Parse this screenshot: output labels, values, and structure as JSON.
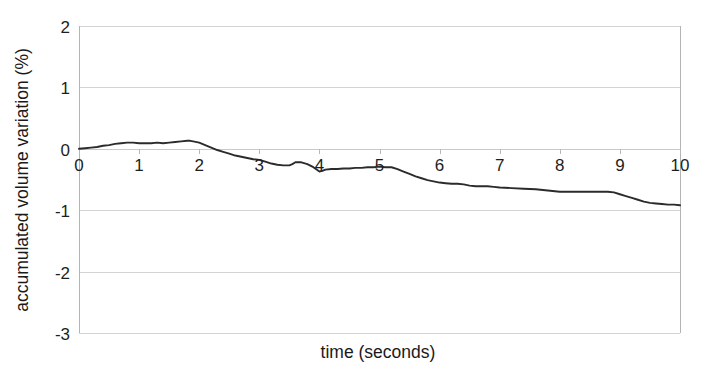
{
  "chart_data": {
    "type": "line",
    "title": "",
    "xlabel": "time (seconds)",
    "ylabel": "accumulated volume variation (%)",
    "xlim": [
      0,
      10
    ],
    "ylim": [
      -3,
      2
    ],
    "xticks": [
      "0",
      "1",
      "2",
      "3",
      "4",
      "5",
      "6",
      "7",
      "8",
      "9",
      "10"
    ],
    "yticks": [
      "2",
      "1",
      "0",
      "-1",
      "-2",
      "-3"
    ],
    "grid": true,
    "legend": "none",
    "series": [
      {
        "name": "accumulated volume variation",
        "color": "#2b2b2b",
        "x": [
          0.0,
          0.1,
          0.2,
          0.3,
          0.4,
          0.5,
          0.6,
          0.7,
          0.8,
          0.9,
          1.0,
          1.1,
          1.2,
          1.3,
          1.4,
          1.5,
          1.6,
          1.7,
          1.8,
          1.85,
          1.9,
          2.0,
          2.1,
          2.2,
          2.3,
          2.4,
          2.5,
          2.6,
          2.7,
          2.8,
          2.9,
          3.0,
          3.1,
          3.2,
          3.3,
          3.4,
          3.5,
          3.55,
          3.6,
          3.7,
          3.8,
          3.9,
          4.0,
          4.05,
          4.1,
          4.2,
          4.3,
          4.4,
          4.5,
          4.6,
          4.7,
          4.8,
          4.9,
          5.0,
          5.1,
          5.2,
          5.3,
          5.4,
          5.5,
          5.6,
          5.7,
          5.8,
          5.9,
          6.0,
          6.1,
          6.2,
          6.3,
          6.4,
          6.5,
          6.6,
          6.7,
          6.8,
          6.9,
          7.0,
          7.2,
          7.4,
          7.6,
          7.8,
          8.0,
          8.2,
          8.4,
          8.6,
          8.8,
          8.9,
          9.0,
          9.1,
          9.2,
          9.3,
          9.4,
          9.5,
          9.6,
          9.7,
          9.8,
          9.9,
          10.0
        ],
        "y": [
          0.0,
          0.01,
          0.02,
          0.03,
          0.05,
          0.06,
          0.08,
          0.09,
          0.1,
          0.1,
          0.09,
          0.09,
          0.09,
          0.1,
          0.09,
          0.1,
          0.11,
          0.12,
          0.13,
          0.13,
          0.12,
          0.1,
          0.06,
          0.02,
          -0.02,
          -0.05,
          -0.08,
          -0.11,
          -0.13,
          -0.15,
          -0.17,
          -0.18,
          -0.21,
          -0.24,
          -0.26,
          -0.27,
          -0.27,
          -0.25,
          -0.22,
          -0.22,
          -0.25,
          -0.3,
          -0.37,
          -0.36,
          -0.34,
          -0.33,
          -0.33,
          -0.32,
          -0.32,
          -0.31,
          -0.31,
          -0.3,
          -0.3,
          -0.29,
          -0.3,
          -0.3,
          -0.33,
          -0.37,
          -0.41,
          -0.45,
          -0.48,
          -0.51,
          -0.53,
          -0.55,
          -0.56,
          -0.57,
          -0.57,
          -0.58,
          -0.6,
          -0.61,
          -0.61,
          -0.61,
          -0.62,
          -0.63,
          -0.64,
          -0.65,
          -0.66,
          -0.68,
          -0.7,
          -0.7,
          -0.7,
          -0.7,
          -0.7,
          -0.71,
          -0.74,
          -0.77,
          -0.8,
          -0.83,
          -0.86,
          -0.88,
          -0.89,
          -0.9,
          -0.91,
          -0.91,
          -0.92
        ]
      }
    ]
  }
}
